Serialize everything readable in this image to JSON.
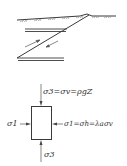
{
  "diagram": {
    "type": "thrust-fault-stress-schematic",
    "colors": {
      "line": "#3a3a3a",
      "hatch": "#8a8a8a",
      "text": "#333333",
      "background": "#ffffff"
    },
    "fault_sketch": {
      "elements": [
        "ground-surface",
        "upper-bed",
        "fault-plane",
        "lower-bed",
        "shear-arrows"
      ]
    },
    "stress_element": {
      "top_label": "σ3=σv=ρgZ",
      "left_label": "σ1",
      "right_label": "σ1=σh=λaσv",
      "bottom_label": "σ3"
    }
  }
}
